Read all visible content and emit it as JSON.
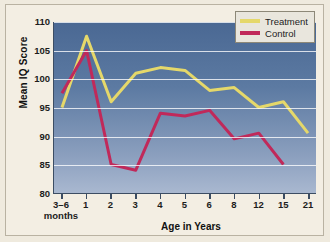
{
  "chart_data": {
    "type": "line",
    "title": "",
    "xlabel": "Age in Years",
    "ylabel": "Mean IQ Score",
    "ylim": [
      80,
      110
    ],
    "yticks": [
      80,
      85,
      90,
      95,
      100,
      105,
      110
    ],
    "grid": true,
    "legend_position": "top-right",
    "categories": [
      "3–6 months",
      "1",
      "2",
      "3",
      "4",
      "5",
      "6",
      "8",
      "12",
      "15",
      "21"
    ],
    "category_main": [
      "3–6",
      "1",
      "2",
      "3",
      "4",
      "5",
      "6",
      "8",
      "12",
      "15",
      "21"
    ],
    "category_sub": [
      "months",
      "",
      "",
      "",
      "",
      "",
      "",
      "",
      "",
      "",
      ""
    ],
    "series": [
      {
        "name": "Treatment",
        "color": "#e5d86a",
        "values": [
          95.0,
          107.5,
          96.0,
          101.0,
          102.0,
          101.5,
          98.0,
          98.5,
          95.0,
          96.0,
          90.5
        ]
      },
      {
        "name": "Control",
        "color": "#c0295a",
        "values": [
          97.5,
          105.0,
          85.0,
          84.0,
          94.0,
          93.5,
          94.5,
          89.5,
          90.5,
          85.0,
          null
        ]
      }
    ]
  },
  "legend": {
    "items": [
      {
        "label": "Treatment",
        "color": "#e5d86a"
      },
      {
        "label": "Control",
        "color": "#c0295a"
      }
    ]
  },
  "colors": {
    "plot_background_top": "#4a6893",
    "plot_background_bottom": "#a9b8d0",
    "figure_background": "#f3eee3",
    "axis": "#3c4d63",
    "gridline": "#ffffff"
  }
}
